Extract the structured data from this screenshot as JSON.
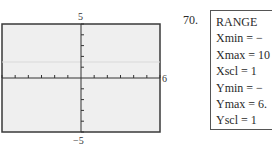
{
  "graph": {
    "y_max_label": "5",
    "y_min_label": "−5",
    "x_max_label": "6",
    "xmin": -6,
    "xmax": 6,
    "xscl": 1,
    "ymin": -5,
    "ymax": 5,
    "yscl": 1,
    "colors": {
      "background": "#efefef",
      "frame": "#3a3a3a",
      "axis": "#333333",
      "guide": "#d9d9d9"
    }
  },
  "problem": {
    "number": "70.",
    "range_title": "RANGE",
    "lines": [
      "Xmin = −",
      "Xmax = 10",
      "Xscl = 1",
      "Ymin = −",
      "Ymax = 6.",
      "Yscl = 1"
    ]
  }
}
